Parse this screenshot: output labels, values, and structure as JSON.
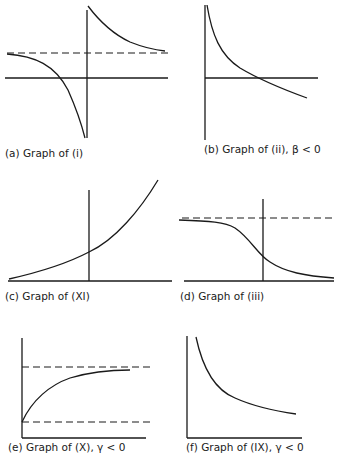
{
  "figure": {
    "panels": [
      {
        "id": "a",
        "caption": "(a) Graph of (i)",
        "features": [
          "horizontal axis",
          "vertical axis (vertical asymptote)",
          "dashed horizontal asymptote",
          "hyperbola-like curve with two branches"
        ]
      },
      {
        "id": "b",
        "caption": "(b) Graph of (ii), β < 0",
        "features": [
          "vertical axis",
          "horizontal axis",
          "decreasing curve crossing horizontal axis"
        ]
      },
      {
        "id": "c",
        "caption": "(c) Graph of (XI)",
        "features": [
          "horizontal axis",
          "vertical axis",
          "increasing convex (exponential-like) curve"
        ]
      },
      {
        "id": "d",
        "caption": "(d) Graph of (iii)",
        "features": [
          "horizontal axis",
          "vertical axis",
          "dashed upper asymptote",
          "decreasing sigmoid curve"
        ]
      },
      {
        "id": "e",
        "caption": "(e) Graph of (X), γ < 0",
        "features": [
          "vertical axis",
          "horizontal axis",
          "two dashed horizontal asymptotes",
          "increasing saturating curve"
        ]
      },
      {
        "id": "f",
        "caption": "(f) Graph of (IX), γ < 0",
        "features": [
          "vertical axis",
          "horizontal axis",
          "decreasing convex curve"
        ]
      }
    ]
  }
}
